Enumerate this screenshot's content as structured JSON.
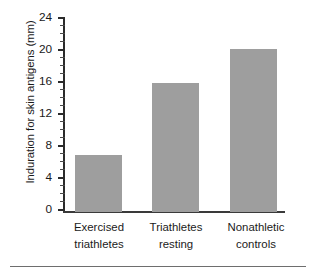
{
  "chart_data": {
    "type": "bar",
    "title": "",
    "xlabel": "",
    "ylabel": "Induration for skin antigens (mm)",
    "categories": [
      "Exercised triathletes",
      "Triathletes resting",
      "Nonathletic controls"
    ],
    "category_lines": [
      [
        "Exercised",
        "triathletes"
      ],
      [
        "Triathletes",
        "resting"
      ],
      [
        "Nonathletic",
        "controls"
      ]
    ],
    "values": [
      7.0,
      16.0,
      20.2
    ],
    "ylim": [
      0,
      24
    ],
    "ytick_labels": [
      "0",
      "4",
      "8",
      "12",
      "16",
      "20",
      "24"
    ],
    "ytick_values": [
      0,
      4,
      8,
      12,
      16,
      20,
      24
    ],
    "yminor_step": 1,
    "grid": false,
    "legend": null,
    "bar_color": "#9e9e9e",
    "axis_color": "#2b2b2b"
  },
  "axis": {
    "tick_0": "0",
    "tick_4": "4",
    "tick_8": "8",
    "tick_12": "12",
    "tick_16": "16",
    "tick_20": "20",
    "tick_24": "24"
  },
  "categories": {
    "cat1_line1": "Exercised",
    "cat1_line2": "triathletes",
    "cat2_line1": "Triathletes",
    "cat2_line2": "resting",
    "cat3_line1": "Nonathletic",
    "cat3_line2": "controls"
  }
}
